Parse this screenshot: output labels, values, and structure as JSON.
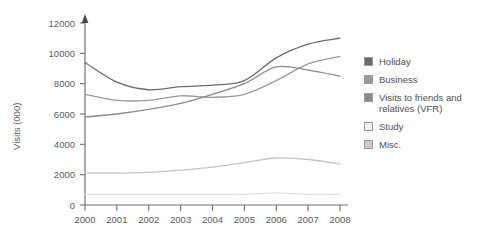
{
  "chart_data": {
    "type": "line",
    "title": "",
    "xlabel": "",
    "ylabel": "Visits (000)",
    "categories": [
      "2000",
      "2001",
      "2002",
      "2003",
      "2004",
      "2005",
      "2006",
      "2007",
      "2008"
    ],
    "x": [
      2000,
      2001,
      2002,
      2003,
      2004,
      2005,
      2006,
      2007,
      2008
    ],
    "ylim": [
      0,
      12000
    ],
    "xlim": [
      2000,
      2008
    ],
    "yticks": [
      0,
      2000,
      4000,
      6000,
      8000,
      10000,
      12000
    ],
    "ytick_labels": [
      "0",
      "2000",
      "4000",
      "6000",
      "8000",
      "10000",
      "12000"
    ],
    "grid": false,
    "legend_position": "right",
    "series": [
      {
        "name": "Holiday",
        "color": "#6b6b6b",
        "values": [
          9400,
          8100,
          7600,
          7800,
          7900,
          8200,
          9700,
          10600,
          11000
        ]
      },
      {
        "name": "Business",
        "color": "#9a9a9a",
        "values": [
          7300,
          6900,
          6900,
          7200,
          7100,
          7300,
          8200,
          9300,
          9800
        ]
      },
      {
        "name": "Visits to friends and relatives (VFR)",
        "color": "#8b8b8b",
        "values": [
          5800,
          6000,
          6300,
          6700,
          7300,
          8000,
          9100,
          8900,
          8500
        ]
      },
      {
        "name": "Study",
        "color": "#e2e2e2",
        "values": [
          700,
          700,
          700,
          700,
          700,
          700,
          800,
          700,
          700
        ]
      },
      {
        "name": "Misc.",
        "color": "#c4c4c4",
        "values": [
          2100,
          2100,
          2150,
          2300,
          2500,
          2800,
          3100,
          3000,
          2700
        ]
      }
    ]
  },
  "legend": {
    "items": [
      {
        "label": "Holiday",
        "color": "#6b6b6b"
      },
      {
        "label": "Business",
        "color": "#9a9a9a"
      },
      {
        "label": "Visits to friends and\nrelatives (VFR)",
        "color": "#8b8b8b"
      },
      {
        "label": "Study",
        "color": "#f0f0f0"
      },
      {
        "label": "Misc.",
        "color": "#c9c9c9"
      }
    ]
  },
  "axes": {
    "y_title": "Visits (000)"
  }
}
